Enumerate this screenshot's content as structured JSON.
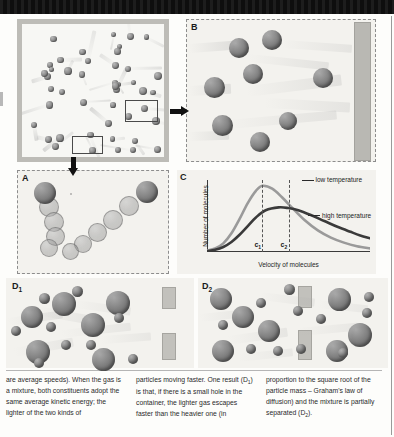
{
  "figure": {
    "panels": {
      "container": {
        "label": "",
        "particle_count": 45
      },
      "a": {
        "label": "A"
      },
      "b": {
        "label": "B"
      },
      "c": {
        "label": "C"
      },
      "d1": {
        "label": "D",
        "sub": "1"
      },
      "d2": {
        "label": "D",
        "sub": "2"
      }
    }
  },
  "chart_data": {
    "type": "line",
    "title": "",
    "xlabel": "Velocity of molecules",
    "ylabel": "Number of molecules",
    "grid": false,
    "legend_position": "inline-right",
    "xlim": [
      0,
      100
    ],
    "ylim": [
      0,
      100
    ],
    "annotations": [
      {
        "text": "c",
        "sub": "1",
        "x": 34,
        "note": "most probable speed, low temperature"
      },
      {
        "text": "c",
        "sub": "2",
        "x": 50,
        "note": "most probable speed, high temperature"
      }
    ],
    "series": [
      {
        "name": "low temperature",
        "color": "#9a9a9a",
        "x": [
          0,
          5,
          10,
          15,
          20,
          25,
          30,
          34,
          40,
          46,
          52,
          60,
          68,
          76,
          84,
          92,
          100
        ],
        "values": [
          2,
          5,
          12,
          26,
          46,
          68,
          85,
          92,
          88,
          76,
          62,
          44,
          30,
          20,
          13,
          8,
          5
        ]
      },
      {
        "name": "high temperature",
        "color": "#3a3a3a",
        "x": [
          0,
          5,
          10,
          15,
          20,
          25,
          30,
          36,
          44,
          50,
          56,
          64,
          72,
          80,
          88,
          94,
          100
        ],
        "values": [
          1,
          3,
          7,
          14,
          24,
          36,
          48,
          58,
          62,
          61,
          58,
          51,
          43,
          35,
          28,
          23,
          19
        ]
      }
    ]
  },
  "legend": {
    "low": "low temperature",
    "high": "high temperature"
  },
  "axes": {
    "y": "Number of molecules",
    "x": "Velocity of molecules",
    "tick_c1": "c",
    "tick_c1_sub": "1",
    "tick_c2": "c",
    "tick_c2_sub": "2"
  },
  "caption": {
    "col1": "are average speeds). When the gas is a mixture, both constituents adopt the same average kinetic energy; the lighter of the two kinds of",
    "col2_part1": "particles moving faster. One result (D",
    "col2_sub1": "1",
    "col2_part2": ") is that, if there is a small hole in the container, the lighter gas escapes faster than the heavier one (in",
    "col3_part1": "proportion to the square root of the particle mass – Graham's law of diffusion) and the mixture is partially separated (D",
    "col3_sub1": "2",
    "col3_part2": ")."
  }
}
